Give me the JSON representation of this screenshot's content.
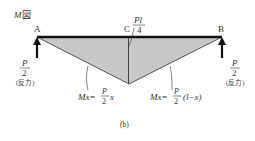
{
  "title": "M図",
  "title_italic_part": "M",
  "title_rest": "図",
  "points": {
    "A": {
      "label": "A",
      "x": 37
    },
    "B": {
      "label": "B",
      "x": 222
    },
    "C": {
      "label": "C",
      "x": 128
    }
  },
  "max_moment": {
    "numerator": "Pl",
    "denominator": "4"
  },
  "reaction_left": {
    "numerator": "P",
    "denominator": "2",
    "note": "(反力)"
  },
  "reaction_right": {
    "numerator": "P",
    "denominator": "2",
    "note": "(反力)"
  },
  "formula_left": {
    "lhs": "Mx=",
    "frac_num": "P",
    "frac_den": "2",
    "rest": "x"
  },
  "formula_right": {
    "lhs": "Mx=",
    "frac_num": "P",
    "frac_den": "2",
    "rest": "(l−x)"
  },
  "caption": "(b)",
  "colors": {
    "beam": "#111111",
    "fill": "#c8c8c8",
    "line": "#333333",
    "text": "#333333"
  }
}
